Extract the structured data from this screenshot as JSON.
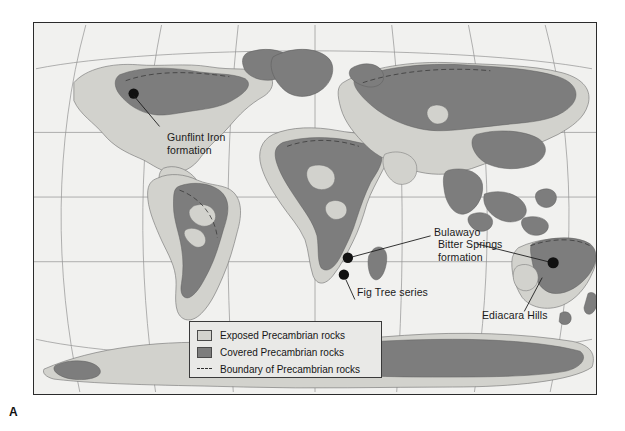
{
  "figure": {
    "panel_letter": "A",
    "background_color": "#ffffff"
  },
  "map": {
    "projection": "curved-graticule world map",
    "frame_color": "#2b2b2b",
    "ocean_color": "#f1f1ef",
    "exposed_color": "#d2d2cd",
    "covered_color": "#7d7d7d",
    "site_dot_color": "#111111",
    "graticule_color": "#8d8d8d"
  },
  "legend": {
    "background_color": "#e9e9e7",
    "border_color": "#3a3a3a",
    "items": [
      {
        "symbol": "light-gray-square",
        "label": "Exposed Precambrian rocks"
      },
      {
        "symbol": "dark-gray-square",
        "label": "Covered Precambrian rocks"
      },
      {
        "symbol": "dashed-line",
        "label": "Boundary of Precambrian rocks"
      }
    ]
  },
  "site_labels": [
    {
      "name": "gunflint",
      "text": "Gunflint Iron\nformation"
    },
    {
      "name": "bulawayo",
      "text": "Bulawayo"
    },
    {
      "name": "fig-tree",
      "text": "Fig Tree series"
    },
    {
      "name": "bitter-springs",
      "text": "Bitter Springs\nformation"
    },
    {
      "name": "ediacara",
      "text": "Ediacara Hills"
    }
  ],
  "sites": [
    {
      "name": "gunflint-iron-formation",
      "x": 133,
      "y": 93
    },
    {
      "name": "bulawayo",
      "x": 348,
      "y": 258
    },
    {
      "name": "fig-tree-series",
      "x": 344,
      "y": 275
    },
    {
      "name": "ediacara-hills",
      "x": 554,
      "y": 263
    }
  ]
}
